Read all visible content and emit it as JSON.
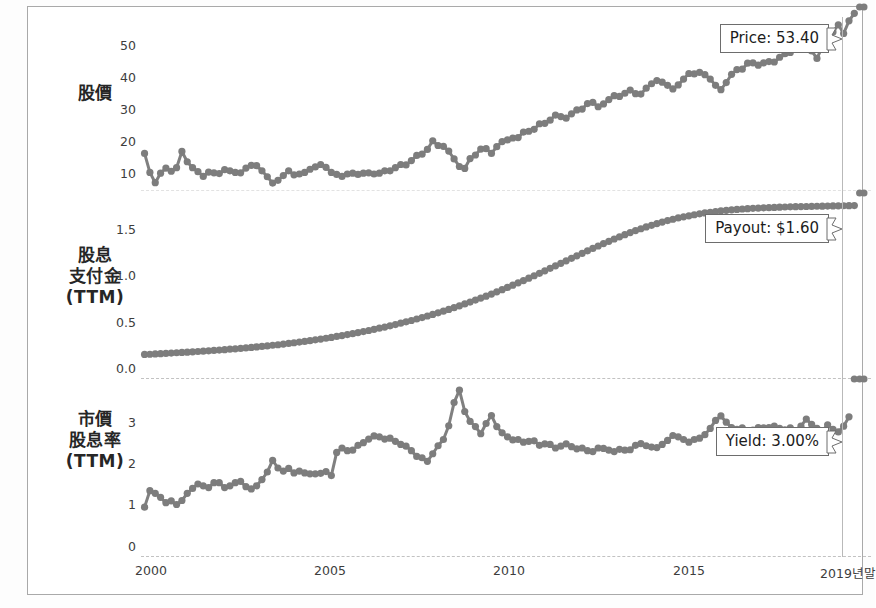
{
  "figure": {
    "background": "#ffffff",
    "frame_color": "#a9a9a9",
    "series_color": "#808080",
    "marker_color": "#7d7d7d"
  },
  "chart_data": [
    {
      "type": "line",
      "title": "股價",
      "panel": "price",
      "ylabel": "股價",
      "xlabel": "",
      "grid": false,
      "legend": "none",
      "ylim": [
        8,
        55
      ],
      "yticks": [
        10,
        20,
        30,
        40,
        50
      ],
      "ytick_labels": [
        "10",
        "20",
        "30",
        "40",
        "50"
      ],
      "xlim": [
        1999.6,
        2019.95
      ],
      "xticks": [
        2000,
        2005,
        2010,
        2015,
        2019.95
      ],
      "xtick_labels": [
        "2000",
        "2005",
        "2010",
        "2015",
        "2019년말"
      ],
      "annotation": "Price: 53.40",
      "last_value": 53.4,
      "x": [
        1999.7,
        1999.85,
        2000.0,
        2000.15,
        2000.3,
        2000.45,
        2000.6,
        2000.75,
        2000.9,
        2001.05,
        2001.2,
        2001.35,
        2001.5,
        2001.65,
        2001.8,
        2001.95,
        2002.1,
        2002.25,
        2002.4,
        2002.55,
        2002.7,
        2002.85,
        2003.0,
        2003.15,
        2003.3,
        2003.45,
        2003.6,
        2003.75,
        2003.9,
        2004.05,
        2004.2,
        2004.35,
        2004.5,
        2004.65,
        2004.8,
        2004.95,
        2005.1,
        2005.25,
        2005.4,
        2005.55,
        2005.7,
        2005.85,
        2006.0,
        2006.15,
        2006.3,
        2006.45,
        2006.6,
        2006.75,
        2006.9,
        2007.05,
        2007.2,
        2007.35,
        2007.5,
        2007.65,
        2007.8,
        2007.95,
        2008.1,
        2008.25,
        2008.4,
        2008.55,
        2008.7,
        2008.85,
        2009.0,
        2009.15,
        2009.3,
        2009.45,
        2009.6,
        2009.75,
        2009.9,
        2010.05,
        2010.2,
        2010.35,
        2010.5,
        2010.65,
        2010.8,
        2010.95,
        2011.1,
        2011.25,
        2011.4,
        2011.55,
        2011.7,
        2011.85,
        2012.0,
        2012.15,
        2012.3,
        2012.45,
        2012.6,
        2012.75,
        2012.9,
        2013.05,
        2013.2,
        2013.35,
        2013.5,
        2013.65,
        2013.8,
        2013.95,
        2014.1,
        2014.25,
        2014.4,
        2014.55,
        2014.7,
        2014.85,
        2015.0,
        2015.15,
        2015.3,
        2015.45,
        2015.6,
        2015.75,
        2015.9,
        2016.05,
        2016.2,
        2016.35,
        2016.5,
        2016.65,
        2016.8,
        2016.95,
        2017.1,
        2017.25,
        2017.4,
        2017.55,
        2017.7,
        2017.85,
        2018.0,
        2018.15,
        2018.3,
        2018.45,
        2018.6,
        2018.75,
        2018.9,
        2019.05,
        2019.2,
        2019.35,
        2019.5,
        2019.65,
        2019.8,
        2019.92
      ],
      "y": [
        18.0,
        13.2,
        10.6,
        13.0,
        14.3,
        13.5,
        14.4,
        18.5,
        15.9,
        14.4,
        13.4,
        12.2,
        13.3,
        13.1,
        12.9,
        13.9,
        13.6,
        13.2,
        13.1,
        14.3,
        15.0,
        14.9,
        13.6,
        12.1,
        10.5,
        11.2,
        12.4,
        13.6,
        12.6,
        12.8,
        13.2,
        14.0,
        14.6,
        15.2,
        14.5,
        13.2,
        12.7,
        12.2,
        12.8,
        13.0,
        12.7,
        13.0,
        13.1,
        12.8,
        13.0,
        13.6,
        13.6,
        14.4,
        15.2,
        15.1,
        16.2,
        17.5,
        17.8,
        19.0,
        21.2,
        20.0,
        19.8,
        18.6,
        16.6,
        14.7,
        14.2,
        16.7,
        17.6,
        19.1,
        19.2,
        18.0,
        19.7,
        21.0,
        21.4,
        21.9,
        22.0,
        23.4,
        23.6,
        24.1,
        25.5,
        25.6,
        26.4,
        27.7,
        27.3,
        26.9,
        28.0,
        29.0,
        29.2,
        30.6,
        30.9,
        29.8,
        30.5,
        31.6,
        32.6,
        32.4,
        33.2,
        34.0,
        33.1,
        33.0,
        34.5,
        35.6,
        36.4,
        36.0,
        35.2,
        34.3,
        35.3,
        36.8,
        38.2,
        38.1,
        38.5,
        37.9,
        36.8,
        35.2,
        34.1,
        35.9,
        38.0,
        39.2,
        39.3,
        40.8,
        40.9,
        40.3,
        40.9,
        41.2,
        41.1,
        42.3,
        43.2,
        43.5,
        45.5,
        44.8,
        45.5,
        43.9,
        42.0,
        44.9,
        46.5,
        48.7,
        50.5,
        48.3,
        51.5,
        53.4
      ]
    },
    {
      "type": "line",
      "title": "股息支付金 (TTM)",
      "panel": "payout",
      "ylabel": "股息\n支付金\n(TTM)",
      "ylabel_lines": [
        "股息",
        "支付金",
        "(TTM)"
      ],
      "xlabel": "",
      "grid": false,
      "legend": "none",
      "ylim": [
        -0.06,
        1.72
      ],
      "yticks": [
        0.0,
        0.5,
        1.0,
        1.5
      ],
      "ytick_labels": [
        "0.0",
        "0.5",
        "1.0",
        "1.5"
      ],
      "xlim": [
        1999.6,
        2019.95
      ],
      "annotation": "Payout: $1.60",
      "last_value": 1.6,
      "x": [
        1999.7,
        1999.85,
        2000.0,
        2000.15,
        2000.3,
        2000.45,
        2000.6,
        2000.75,
        2000.9,
        2001.05,
        2001.2,
        2001.35,
        2001.5,
        2001.65,
        2001.8,
        2001.95,
        2002.1,
        2002.25,
        2002.4,
        2002.55,
        2002.7,
        2002.85,
        2003.0,
        2003.15,
        2003.3,
        2003.45,
        2003.6,
        2003.75,
        2003.9,
        2004.05,
        2004.2,
        2004.35,
        2004.5,
        2004.65,
        2004.8,
        2004.95,
        2005.1,
        2005.25,
        2005.4,
        2005.55,
        2005.7,
        2005.85,
        2006.0,
        2006.15,
        2006.3,
        2006.45,
        2006.6,
        2006.75,
        2006.9,
        2007.05,
        2007.2,
        2007.35,
        2007.5,
        2007.65,
        2007.8,
        2007.95,
        2008.1,
        2008.25,
        2008.4,
        2008.55,
        2008.7,
        2008.85,
        2009.0,
        2009.15,
        2009.3,
        2009.45,
        2009.6,
        2009.75,
        2009.9,
        2010.05,
        2010.2,
        2010.35,
        2010.5,
        2010.65,
        2010.8,
        2010.95,
        2011.1,
        2011.25,
        2011.4,
        2011.55,
        2011.7,
        2011.85,
        2012.0,
        2012.15,
        2012.3,
        2012.45,
        2012.6,
        2012.75,
        2012.9,
        2013.05,
        2013.2,
        2013.35,
        2013.5,
        2013.65,
        2013.8,
        2013.95,
        2014.1,
        2014.25,
        2014.4,
        2014.55,
        2014.7,
        2014.85,
        2015.0,
        2015.15,
        2015.3,
        2015.45,
        2015.6,
        2015.75,
        2015.9,
        2016.05,
        2016.2,
        2016.35,
        2016.5,
        2016.65,
        2016.8,
        2016.95,
        2017.1,
        2017.25,
        2017.4,
        2017.55,
        2017.7,
        2017.85,
        2018.0,
        2018.15,
        2018.3,
        2018.45,
        2018.6,
        2018.75,
        2018.9,
        2019.05,
        2019.2,
        2019.35,
        2019.5,
        2019.65,
        2019.8,
        2019.92
      ],
      "y": [
        0.175,
        0.177,
        0.18,
        0.182,
        0.185,
        0.188,
        0.191,
        0.194,
        0.197,
        0.2,
        0.203,
        0.206,
        0.21,
        0.213,
        0.217,
        0.221,
        0.225,
        0.229,
        0.233,
        0.237,
        0.242,
        0.247,
        0.252,
        0.257,
        0.263,
        0.268,
        0.274,
        0.28,
        0.287,
        0.293,
        0.3,
        0.307,
        0.315,
        0.322,
        0.33,
        0.338,
        0.347,
        0.356,
        0.365,
        0.374,
        0.384,
        0.394,
        0.404,
        0.415,
        0.426,
        0.437,
        0.449,
        0.461,
        0.474,
        0.487,
        0.5,
        0.514,
        0.528,
        0.543,
        0.558,
        0.573,
        0.589,
        0.606,
        0.623,
        0.64,
        0.658,
        0.676,
        0.695,
        0.714,
        0.733,
        0.753,
        0.774,
        0.795,
        0.816,
        0.838,
        0.86,
        0.882,
        0.905,
        0.928,
        0.951,
        0.975,
        0.999,
        1.023,
        1.047,
        1.071,
        1.095,
        1.119,
        1.143,
        1.167,
        1.19,
        1.213,
        1.236,
        1.258,
        1.28,
        1.301,
        1.321,
        1.341,
        1.36,
        1.378,
        1.395,
        1.411,
        1.427,
        1.442,
        1.456,
        1.469,
        1.481,
        1.492,
        1.502,
        1.512,
        1.521,
        1.529,
        1.536,
        1.543,
        1.549,
        1.554,
        1.559,
        1.563,
        1.567,
        1.57,
        1.573,
        1.576,
        1.578,
        1.58,
        1.582,
        1.584,
        1.586,
        1.588,
        1.589,
        1.59,
        1.591,
        1.592,
        1.593,
        1.594,
        1.595,
        1.596,
        1.597,
        1.598,
        1.599,
        1.6
      ]
    },
    {
      "type": "line",
      "title": "市價股息率 (TTM)",
      "panel": "yield",
      "ylabel": "市價\n股息率\n(TTM)",
      "ylabel_lines": [
        "市價",
        "股息率",
        "(TTM)"
      ],
      "xlabel": "",
      "grid": false,
      "legend": "none",
      "ylim": [
        -0.15,
        3.85
      ],
      "yticks": [
        0,
        1,
        2,
        3
      ],
      "ytick_labels": [
        "0",
        "1",
        "2",
        "3"
      ],
      "xlim": [
        1999.6,
        2019.95
      ],
      "annotation": "Yield: 3.00%",
      "last_value": 3.0,
      "x": [
        1999.7,
        1999.85,
        2000.0,
        2000.15,
        2000.3,
        2000.45,
        2000.6,
        2000.75,
        2000.9,
        2001.05,
        2001.2,
        2001.35,
        2001.5,
        2001.65,
        2001.8,
        2001.95,
        2002.1,
        2002.25,
        2002.4,
        2002.55,
        2002.7,
        2002.85,
        2003.0,
        2003.15,
        2003.3,
        2003.45,
        2003.6,
        2003.75,
        2003.9,
        2004.05,
        2004.2,
        2004.35,
        2004.5,
        2004.65,
        2004.8,
        2004.95,
        2005.1,
        2005.25,
        2005.4,
        2005.55,
        2005.7,
        2005.85,
        2006.0,
        2006.15,
        2006.3,
        2006.45,
        2006.6,
        2006.75,
        2006.9,
        2007.05,
        2007.2,
        2007.35,
        2007.5,
        2007.65,
        2007.8,
        2007.95,
        2008.1,
        2008.25,
        2008.4,
        2008.55,
        2008.7,
        2008.85,
        2009.0,
        2009.15,
        2009.3,
        2009.45,
        2009.6,
        2009.75,
        2009.9,
        2010.05,
        2010.2,
        2010.35,
        2010.5,
        2010.65,
        2010.8,
        2010.95,
        2011.1,
        2011.25,
        2011.4,
        2011.55,
        2011.7,
        2011.85,
        2012.0,
        2012.15,
        2012.3,
        2012.45,
        2012.6,
        2012.75,
        2012.9,
        2013.05,
        2013.2,
        2013.35,
        2013.5,
        2013.65,
        2013.8,
        2013.95,
        2014.1,
        2014.25,
        2014.4,
        2014.55,
        2014.7,
        2014.85,
        2015.0,
        2015.15,
        2015.3,
        2015.45,
        2015.6,
        2015.75,
        2015.9,
        2016.05,
        2016.2,
        2016.35,
        2016.5,
        2016.65,
        2016.8,
        2016.95,
        2017.1,
        2017.25,
        2017.4,
        2017.55,
        2017.7,
        2017.85,
        2018.0,
        2018.15,
        2018.3,
        2018.45,
        2018.6,
        2018.75,
        2018.9,
        2019.05,
        2019.2,
        2019.35,
        2019.5,
        2019.65,
        2019.8,
        2019.92
      ],
      "y": [
        0.97,
        1.34,
        1.28,
        1.19,
        1.07,
        1.11,
        1.03,
        1.12,
        1.28,
        1.39,
        1.49,
        1.45,
        1.41,
        1.52,
        1.52,
        1.41,
        1.45,
        1.52,
        1.55,
        1.43,
        1.38,
        1.45,
        1.59,
        1.76,
        2.02,
        1.85,
        1.78,
        1.84,
        1.74,
        1.78,
        1.74,
        1.72,
        1.72,
        1.73,
        1.77,
        1.68,
        2.2,
        2.3,
        2.24,
        2.25,
        2.36,
        2.42,
        2.5,
        2.57,
        2.55,
        2.5,
        2.52,
        2.45,
        2.38,
        2.34,
        2.24,
        2.11,
        2.08,
        2.0,
        2.17,
        2.35,
        2.49,
        2.8,
        3.32,
        3.6,
        3.12,
        2.9,
        2.78,
        2.62,
        2.85,
        3.03,
        2.78,
        2.64,
        2.55,
        2.48,
        2.49,
        2.43,
        2.45,
        2.46,
        2.36,
        2.39,
        2.38,
        2.3,
        2.34,
        2.39,
        2.33,
        2.28,
        2.3,
        2.24,
        2.22,
        2.3,
        2.29,
        2.25,
        2.22,
        2.27,
        2.25,
        2.26,
        2.36,
        2.4,
        2.35,
        2.32,
        2.31,
        2.38,
        2.47,
        2.58,
        2.55,
        2.49,
        2.43,
        2.49,
        2.52,
        2.6,
        2.74,
        2.92,
        3.02,
        2.88,
        2.76,
        2.72,
        2.75,
        2.68,
        2.7,
        2.76,
        2.75,
        2.76,
        2.79,
        2.74,
        2.71,
        2.75,
        2.68,
        2.79,
        2.95,
        2.83,
        2.74,
        2.68,
        2.82,
        2.72,
        2.66,
        2.79,
        3.0
      ]
    }
  ],
  "panels": [
    {
      "name": "price",
      "row_label": "股價",
      "row_label_lines": [
        "股價"
      ],
      "annotation": "Price: 53.40"
    },
    {
      "name": "payout",
      "row_label": "股息支付金(TTM)",
      "row_label_lines": [
        "股息",
        "支付金",
        "(TTM)"
      ],
      "annotation": "Payout: $1.60"
    },
    {
      "name": "yield",
      "row_label": "市價股息率(TTM)",
      "row_label_lines": [
        "市價",
        "股息率",
        "(TTM)"
      ],
      "annotation": "Yield: 3.00%"
    }
  ],
  "xaxis": {
    "tick_labels": [
      "2000",
      "2005",
      "2010",
      "2015",
      "2019년말"
    ],
    "tick_values": [
      2000,
      2005,
      2010,
      2015,
      2019.95
    ]
  }
}
